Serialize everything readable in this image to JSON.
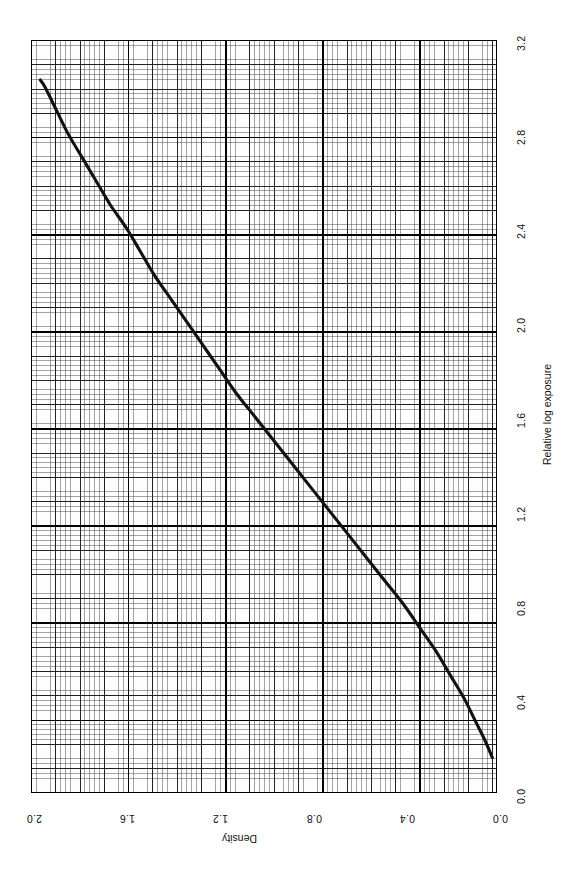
{
  "figure": {
    "background_color": "#ffffff",
    "plot_background_color": "#fdfdfd",
    "curve_color": "#111111",
    "grid_color": "#282828",
    "orientation_note": "rotated",
    "axes": {
      "exposure": {
        "title": "Relative log exposure",
        "ticks": [
          "0.0",
          "0.4",
          "0.8",
          "1.2",
          "1.6",
          "2.0",
          "2.4",
          "2.8",
          "3.2"
        ]
      },
      "density": {
        "title": "Density",
        "ticks": [
          "0.0",
          "0.4",
          "0.8",
          "1.2",
          "1.6",
          "2.0"
        ]
      }
    }
  },
  "chart_data": {
    "type": "line",
    "title": "",
    "subtitle": "",
    "xlabel": "Relative log exposure",
    "ylabel": "Density",
    "xlim": [
      0.0,
      3.2
    ],
    "ylim": [
      0.0,
      2.0
    ],
    "xticks": [
      0.0,
      0.4,
      0.8,
      1.2,
      1.6,
      2.0,
      2.4,
      2.8,
      3.2
    ],
    "yticks": [
      0.0,
      0.4,
      0.8,
      1.2,
      1.6,
      2.0
    ],
    "grid": true,
    "legend": "none",
    "annotations": [],
    "series": [
      {
        "name": "characteristic curve",
        "x": [
          0.15,
          0.22,
          0.3,
          0.4,
          0.5,
          0.6,
          0.7,
          0.8,
          0.9,
          1.0,
          1.1,
          1.2,
          1.3,
          1.4,
          1.5,
          1.6,
          1.7,
          1.8,
          1.9,
          2.0,
          2.1,
          2.2,
          2.3,
          2.4,
          2.5,
          2.6,
          2.7,
          2.8,
          2.9,
          3.0,
          3.03
        ],
        "y": [
          0.02,
          0.05,
          0.09,
          0.14,
          0.2,
          0.26,
          0.33,
          0.4,
          0.48,
          0.56,
          0.64,
          0.72,
          0.8,
          0.88,
          0.96,
          1.04,
          1.12,
          1.19,
          1.26,
          1.33,
          1.4,
          1.47,
          1.53,
          1.59,
          1.66,
          1.72,
          1.78,
          1.84,
          1.89,
          1.94,
          1.96
        ]
      }
    ]
  }
}
